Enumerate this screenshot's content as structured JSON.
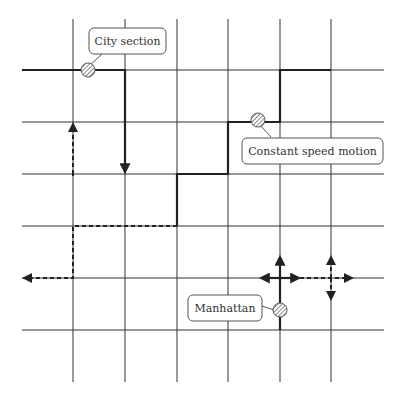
{
  "diagram": {
    "colors": {
      "line": "#222222",
      "grid": "#333333",
      "marker_fill": "#bbbbbb",
      "background": "#ffffff"
    },
    "grid": {
      "columns": 6,
      "rows": 6
    },
    "labels": {
      "city_section": "City section",
      "constant_speed": "Constant speed motion",
      "manhattan": "Manhattan"
    },
    "paths": [
      {
        "name": "city-section-path",
        "style": "solid",
        "description": "Horizontal along row 1 then down column 2 with arrow"
      },
      {
        "name": "constant-speed-path",
        "style": "solid",
        "description": "Staircase path from row 3 up to row 1"
      },
      {
        "name": "dashed-path",
        "style": "dashed",
        "description": "Dashed route with arrows up and left"
      },
      {
        "name": "manhattan-moves",
        "style": "solid+dashed",
        "description": "Possible turns at intersections"
      }
    ],
    "markers": [
      "city-section-node",
      "constant-speed-node",
      "manhattan-node"
    ]
  }
}
